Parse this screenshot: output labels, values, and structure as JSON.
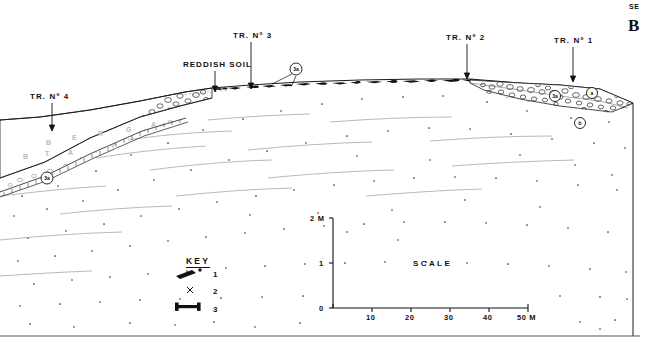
{
  "figure": {
    "id": "B",
    "orientation_right": "SE",
    "type": "geological-archaeological-cross-section"
  },
  "annotations": {
    "trench_labels": [
      {
        "name": "trench-4",
        "text": "TR. Nº 4",
        "x": 30,
        "y": 92,
        "arrow_x": 52,
        "arrow_y0": 103,
        "arrow_y1": 131
      },
      {
        "name": "trench-3",
        "text": "TR. Nº 3",
        "x": 233,
        "y": 31,
        "arrow_x": 251,
        "arrow_y0": 42,
        "arrow_y1": 89
      },
      {
        "name": "trench-2",
        "text": "TR. Nº 2",
        "x": 446,
        "y": 33,
        "arrow_x": 467,
        "arrow_y0": 44,
        "arrow_y1": 79
      },
      {
        "name": "trench-1",
        "text": "TR. Nº 1",
        "x": 554,
        "y": 36,
        "arrow_x": 573,
        "arrow_y0": 47,
        "arrow_y1": 82
      }
    ],
    "soil_label": {
      "text": "REDDISH SOIL",
      "x": 183,
      "y": 60,
      "arrow_x": 215,
      "arrow_y0": 71,
      "arrow_y1": 92
    },
    "circled_markers": [
      {
        "label": "3a",
        "x": 296,
        "y": 69,
        "r": 6
      },
      {
        "label": "3a",
        "x": 47,
        "y": 178,
        "r": 6
      },
      {
        "label": "3a",
        "x": 555,
        "y": 96,
        "r": 5.5
      },
      {
        "label": "a",
        "x": 592,
        "y": 93,
        "r": 5.5
      },
      {
        "label": "b",
        "x": 580,
        "y": 123,
        "r": 5.5
      }
    ],
    "faint_bed_letters": [
      {
        "text": "B",
        "x": 46,
        "y": 139
      },
      {
        "text": "E",
        "x": 72,
        "y": 134
      },
      {
        "text": "R",
        "x": 98,
        "y": 130
      },
      {
        "text": "G",
        "x": 126,
        "y": 126
      },
      {
        "text": "A",
        "x": 151,
        "y": 121
      },
      {
        "text": "B",
        "x": 23,
        "y": 153
      },
      {
        "text": "T",
        "x": 45,
        "y": 150
      },
      {
        "text": "A",
        "x": 68,
        "y": 149
      },
      {
        "text": "C",
        "x": 112,
        "y": 143
      }
    ]
  },
  "key": {
    "title": "KEY",
    "title_x": 186,
    "title_y": 256,
    "items": [
      {
        "num": "1",
        "symbol": "flake",
        "sym_x": 178,
        "sym_y": 275,
        "num_x": 213,
        "num_y": 270
      },
      {
        "num": "2",
        "symbol": "x",
        "sym_x": 190,
        "sym_y": 290,
        "num_x": 213,
        "num_y": 287
      },
      {
        "num": "3",
        "symbol": "bone",
        "sym_x": 178,
        "sym_y": 312,
        "num_x": 213,
        "num_y": 305
      }
    ]
  },
  "scale": {
    "word": "SCALE",
    "word_x": 413,
    "word_y": 259,
    "y_axis": {
      "x": 333,
      "top_y": 218,
      "bottom_y": 308,
      "ticks": [
        {
          "label": "2 M",
          "value": 2,
          "y": 218,
          "lx": 310,
          "ly": 214
        },
        {
          "label": "1",
          "value": 1,
          "y": 263,
          "lx": 319,
          "ly": 259
        },
        {
          "label": "0",
          "value": 0,
          "y": 308,
          "lx": 319,
          "ly": 304
        }
      ]
    },
    "x_axis": {
      "y": 308,
      "left_x": 333,
      "right_x": 528,
      "ticks": [
        {
          "label": "10",
          "value": 10,
          "x": 372,
          "lx": 366,
          "ly": 313
        },
        {
          "label": "20",
          "value": 20,
          "x": 411,
          "lx": 405,
          "ly": 313
        },
        {
          "label": "30",
          "value": 30,
          "x": 450,
          "lx": 444,
          "ly": 313
        },
        {
          "label": "40",
          "value": 40,
          "x": 489,
          "lx": 483,
          "ly": 313
        },
        {
          "label": "50 M",
          "value": 50,
          "x": 528,
          "lx": 517,
          "ly": 313
        }
      ]
    }
  },
  "corner": {
    "se_x": 629,
    "se_y": 4,
    "b_x": 629,
    "b_y": 22
  }
}
